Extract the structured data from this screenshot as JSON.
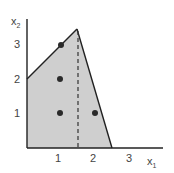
{
  "diagram": {
    "type": "feasible-region",
    "axes": {
      "x_label": "x",
      "x_sub": "1",
      "y_label": "x",
      "y_sub": "2",
      "x_ticks": [
        "1",
        "2",
        "3"
      ],
      "y_ticks": [
        "1",
        "2",
        "3"
      ]
    },
    "region": {
      "vertices": [
        [
          0,
          0
        ],
        [
          0,
          2
        ],
        [
          1.5,
          3.5
        ],
        [
          2.5,
          0
        ]
      ],
      "fill": "#cfcfcf",
      "stroke": "#222222"
    },
    "dashed_line": {
      "x": 1.5,
      "from_y": 0,
      "to_y": 3.5
    },
    "points": [
      [
        1,
        3
      ],
      [
        1,
        2
      ],
      [
        1,
        1
      ],
      [
        2,
        1
      ]
    ],
    "point_color": "#2a2a2a"
  }
}
